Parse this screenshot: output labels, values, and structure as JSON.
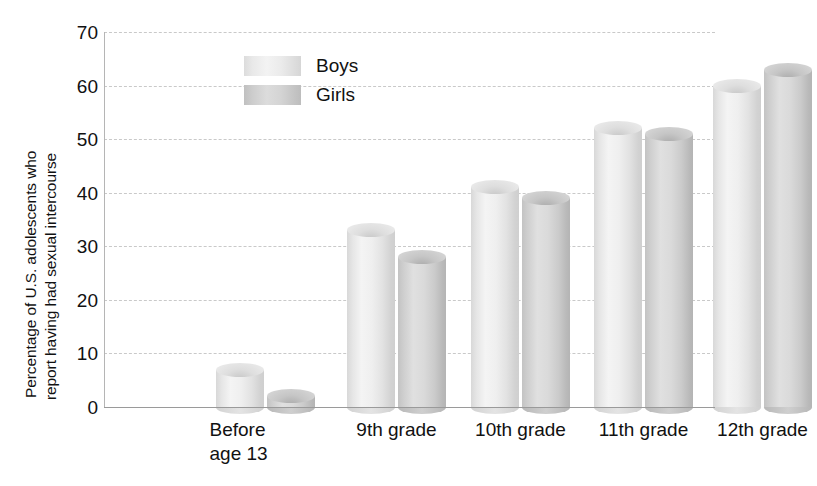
{
  "chart_data": {
    "type": "bar",
    "title": "",
    "subtitle": "",
    "xlabel": "",
    "ylabel": "Percentage of U.S. adolescents who report having had sexual intercourse",
    "ylabel_lines": [
      "Percentage of U.S. adolescents who",
      "report having had sexual intercourse"
    ],
    "categories": [
      "Before age 13",
      "9th grade",
      "10th grade",
      "11th grade",
      "12th grade"
    ],
    "category_label_lines": [
      [
        "Before",
        "age 13"
      ],
      [
        "9th grade"
      ],
      [
        "10th grade"
      ],
      [
        "11th grade"
      ],
      [
        "12th grade"
      ]
    ],
    "series": [
      {
        "name": "Boys",
        "values": [
          7,
          33,
          41,
          52,
          60
        ],
        "color": "#ebebeb"
      },
      {
        "name": "Girls",
        "values": [
          2,
          28,
          39,
          51,
          63
        ],
        "color": "#d2d2d2"
      }
    ],
    "ylim": [
      0,
      70
    ],
    "yticks": [
      0,
      10,
      20,
      30,
      40,
      50,
      60,
      70
    ],
    "ytick_labels": [
      "0",
      "10",
      "20",
      "30",
      "40",
      "50",
      "60",
      "70"
    ],
    "grid": true,
    "grid_style": "dashed",
    "legend_position": "top-left-inside",
    "bar_style": "3d-cylinder"
  },
  "legend": {
    "items": [
      {
        "label": "Boys"
      },
      {
        "label": "Girls"
      }
    ]
  },
  "axes": {
    "y_title_line1": "Percentage of U.S. adolescents who",
    "y_title_line2": "report having had sexual intercourse"
  }
}
